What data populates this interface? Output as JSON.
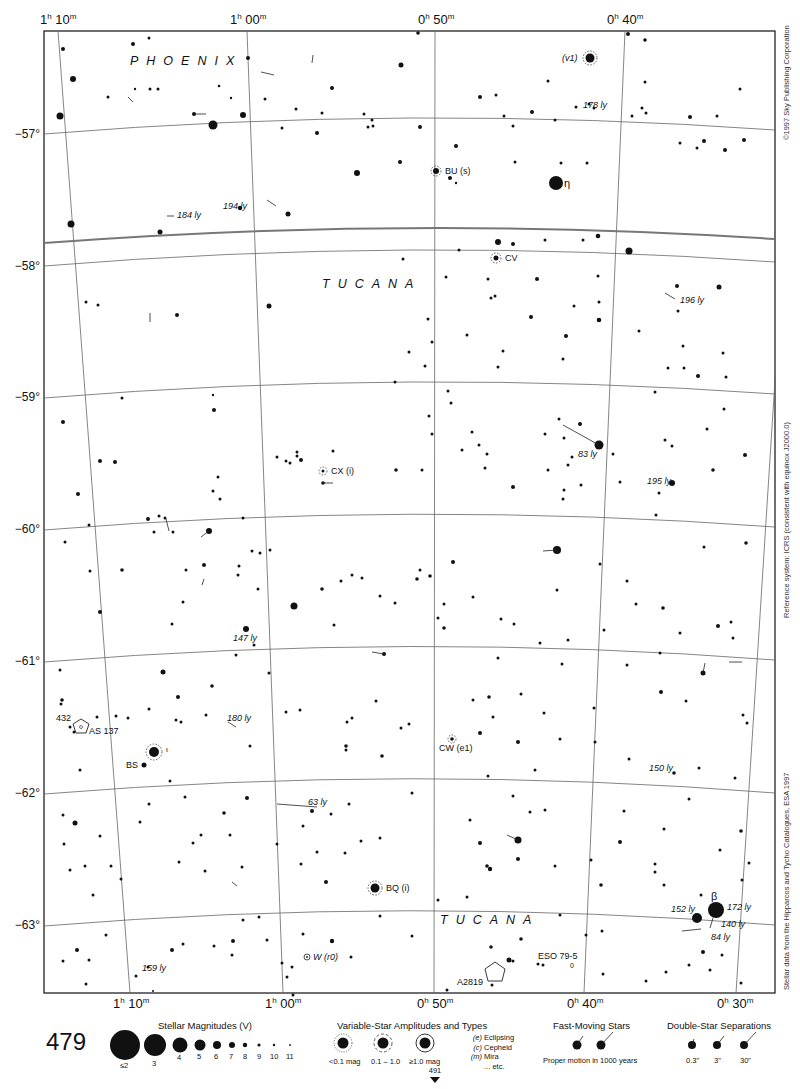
{
  "page": {
    "number": "479",
    "next_page": "491"
  },
  "side_texts": {
    "copyright": "©1997 Sky Publishing Corporation",
    "reference": "Reference system: ICRS (consistent with equinox J2000.0)",
    "source": "Stellar data from the Hipparcos and Tycho Catalogues, ESA 1997"
  },
  "axes": {
    "ra_top": [
      {
        "h": "1",
        "m": "10",
        "x": 40
      },
      {
        "h": "1",
        "m": "00",
        "x": 230
      },
      {
        "h": "0",
        "m": "50",
        "x": 418
      },
      {
        "h": "0",
        "m": "40",
        "x": 607
      }
    ],
    "ra_bottom": [
      {
        "h": "1",
        "m": "10",
        "x": 113
      },
      {
        "h": "1",
        "m": "00",
        "x": 265
      },
      {
        "h": "0",
        "m": "50",
        "x": 417
      },
      {
        "h": "0",
        "m": "40",
        "x": 567
      },
      {
        "h": "0",
        "m": "30",
        "x": 717
      }
    ],
    "dec": [
      {
        "label": "−57°",
        "y": 135
      },
      {
        "label": "−58°",
        "y": 267
      },
      {
        "label": "−59°",
        "y": 398
      },
      {
        "label": "−60°",
        "y": 530
      },
      {
        "label": "−61°",
        "y": 662
      },
      {
        "label": "−62°",
        "y": 794
      },
      {
        "label": "−63°",
        "y": 926
      }
    ]
  },
  "constellations": [
    {
      "name": "PHOENIX",
      "x": 130,
      "y": 67
    },
    {
      "name": "TUCANA",
      "x": 322,
      "y": 289
    },
    {
      "name": "TUCANA",
      "x": 440,
      "y": 925
    }
  ],
  "labels": {
    "eta": "η",
    "beta": "β",
    "iota": "ι",
    "v1": "(v1)",
    "bu": "BU (s)",
    "cv": "CV",
    "cx": "CX (i)",
    "cw": "CW (e1)",
    "bq": "BQ (i)",
    "bs": "BS",
    "w": "W (r0)",
    "as137": "AS 137",
    "n432": "432",
    "a2819": "A2819",
    "eso": "ESO 79-5",
    "eso_sub": "0",
    "ly178": "178 ly",
    "ly194": "194 ly",
    "ly184": "184 ly",
    "ly196": "196 ly",
    "ly83": "83 ly",
    "ly195": "195 ly",
    "ly147": "147 ly",
    "ly180": "180 ly",
    "ly63": "63 ly",
    "ly150": "150 ly",
    "ly152": "152 ly",
    "ly172": "172 ly",
    "ly140": "140 ly",
    "ly84": "84 ly",
    "ly159": "159 ly"
  },
  "legend": {
    "magnitudes": {
      "title": "Stellar Magnitudes (V)",
      "items": [
        "≤2",
        "3",
        "4",
        "5",
        "6",
        "7",
        "8",
        "9",
        "10",
        "11"
      ]
    },
    "variables": {
      "title": "Variable-Star Amplitudes and Types",
      "amplitudes": [
        "<0.1 mag",
        "0.1 – 1.0",
        "≥1.0 mag"
      ],
      "types": [
        {
          "code": "(e)",
          "name": "Eclipsing"
        },
        {
          "code": "(c)",
          "name": "Cepheid"
        },
        {
          "code": "(m)",
          "name": "Mira"
        },
        {
          "code": "",
          "name": "... etc."
        }
      ]
    },
    "fast_moving": {
      "title": "Fast-Moving Stars",
      "caption": "Proper motion in 1000 years"
    },
    "doubles": {
      "title": "Double-Star Separations",
      "items": [
        "0.3\"",
        "3\"",
        "30\""
      ]
    }
  },
  "colors": {
    "ink": "#111111",
    "grid": "#555555",
    "border": "#222222",
    "paper": "#ffffff"
  }
}
